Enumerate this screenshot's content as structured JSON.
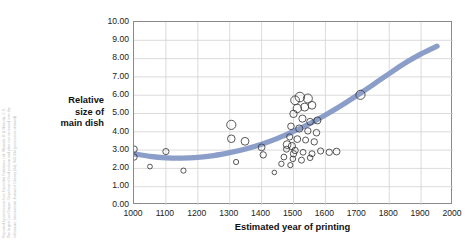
{
  "credit": {
    "lines": [
      "Reprinted by permission from Macmillan Publishers Ltd: Wansink, B. & Wansink, C.S.",
      "The largest Last Supper: Depictions of food portions and plate size increased over the",
      "millennium, International Journal of Obesity (34), 943–944 (permission obtained)"
    ]
  },
  "axes": {
    "y_title": "Relative size of main dish",
    "y_title_lines": [
      "Relative",
      "size of",
      "main dish"
    ],
    "x_title": "Estimated year of printing",
    "y_ticks": [
      "0.00",
      "1.00",
      "2.00",
      "3.00",
      "4.00",
      "5.00",
      "6.00",
      "7.00",
      "8.00",
      "9.00",
      "10.00"
    ],
    "x_ticks": [
      "1000",
      "1100",
      "1200",
      "1300",
      "1400",
      "1500",
      "1600",
      "1700",
      "1800",
      "1900",
      "2000"
    ]
  },
  "colors": {
    "trend_line": "#8b9dc9",
    "marker_stroke": "#3a3a3a",
    "grid": "#d2d2d2",
    "axis": "#8a8a8a",
    "credit_text": "#b9b9b9"
  },
  "chart_data": {
    "type": "scatter",
    "title": "",
    "xlabel": "Estimated year of printing",
    "ylabel": "Relative size of main dish",
    "xlim": [
      1000,
      2000
    ],
    "ylim": [
      0,
      10
    ],
    "xtick_step": 100,
    "ytick_step": 1,
    "grid": true,
    "legend": "none",
    "marker": "open-circle",
    "marker_size_encodes": "bubble-size",
    "points": [
      {
        "x": 1000,
        "y": 3.05,
        "r": 3.3
      },
      {
        "x": 1000,
        "y": 2.62,
        "r": 3.2
      },
      {
        "x": 1050,
        "y": 2.1,
        "r": 2.4
      },
      {
        "x": 1100,
        "y": 2.92,
        "r": 3.1
      },
      {
        "x": 1155,
        "y": 1.88,
        "r": 2.6
      },
      {
        "x": 1305,
        "y": 4.38,
        "r": 4.6
      },
      {
        "x": 1305,
        "y": 3.62,
        "r": 3.8
      },
      {
        "x": 1348,
        "y": 3.48,
        "r": 3.9
      },
      {
        "x": 1320,
        "y": 2.35,
        "r": 2.6
      },
      {
        "x": 1400,
        "y": 3.15,
        "r": 3.4
      },
      {
        "x": 1405,
        "y": 2.74,
        "r": 3.2
      },
      {
        "x": 1440,
        "y": 1.78,
        "r": 2.3
      },
      {
        "x": 1480,
        "y": 3.3,
        "r": 3.9
      },
      {
        "x": 1495,
        "y": 3.22,
        "r": 3.6
      },
      {
        "x": 1500,
        "y": 2.8,
        "r": 3.2
      },
      {
        "x": 1505,
        "y": 5.72,
        "r": 4.4
      },
      {
        "x": 1520,
        "y": 5.9,
        "r": 4.8
      },
      {
        "x": 1545,
        "y": 5.82,
        "r": 4.5
      },
      {
        "x": 1512,
        "y": 5.28,
        "r": 4.2
      },
      {
        "x": 1535,
        "y": 5.35,
        "r": 4.0
      },
      {
        "x": 1558,
        "y": 5.45,
        "r": 3.9
      },
      {
        "x": 1500,
        "y": 4.98,
        "r": 3.7
      },
      {
        "x": 1528,
        "y": 4.72,
        "r": 3.6
      },
      {
        "x": 1552,
        "y": 4.55,
        "r": 3.4
      },
      {
        "x": 1575,
        "y": 4.62,
        "r": 3.5
      },
      {
        "x": 1492,
        "y": 4.3,
        "r": 3.3
      },
      {
        "x": 1518,
        "y": 4.18,
        "r": 3.6
      },
      {
        "x": 1545,
        "y": 4.05,
        "r": 3.2
      },
      {
        "x": 1572,
        "y": 3.95,
        "r": 3.3
      },
      {
        "x": 1488,
        "y": 3.72,
        "r": 3.1
      },
      {
        "x": 1512,
        "y": 3.6,
        "r": 3.4
      },
      {
        "x": 1538,
        "y": 3.55,
        "r": 3.0
      },
      {
        "x": 1565,
        "y": 3.45,
        "r": 3.2
      },
      {
        "x": 1478,
        "y": 3.05,
        "r": 3.0
      },
      {
        "x": 1505,
        "y": 2.98,
        "r": 3.2
      },
      {
        "x": 1530,
        "y": 2.88,
        "r": 2.9
      },
      {
        "x": 1558,
        "y": 2.8,
        "r": 3.0
      },
      {
        "x": 1585,
        "y": 2.95,
        "r": 3.1
      },
      {
        "x": 1470,
        "y": 2.62,
        "r": 2.9
      },
      {
        "x": 1498,
        "y": 2.52,
        "r": 2.8
      },
      {
        "x": 1525,
        "y": 2.45,
        "r": 3.0
      },
      {
        "x": 1552,
        "y": 2.58,
        "r": 2.8
      },
      {
        "x": 1612,
        "y": 2.88,
        "r": 3.2
      },
      {
        "x": 1635,
        "y": 2.92,
        "r": 3.4
      },
      {
        "x": 1462,
        "y": 2.25,
        "r": 2.7
      },
      {
        "x": 1490,
        "y": 2.18,
        "r": 2.6
      },
      {
        "x": 1710,
        "y": 6.02,
        "r": 4.6
      }
    ],
    "trend": {
      "label": "fitted trend",
      "color": "#8b9dc9",
      "width_px": 5.2,
      "points": [
        {
          "x": 1000,
          "y": 2.8
        },
        {
          "x": 1050,
          "y": 2.66
        },
        {
          "x": 1100,
          "y": 2.58
        },
        {
          "x": 1150,
          "y": 2.56
        },
        {
          "x": 1200,
          "y": 2.6
        },
        {
          "x": 1250,
          "y": 2.7
        },
        {
          "x": 1300,
          "y": 2.86
        },
        {
          "x": 1350,
          "y": 3.06
        },
        {
          "x": 1400,
          "y": 3.32
        },
        {
          "x": 1450,
          "y": 3.64
        },
        {
          "x": 1500,
          "y": 4.02
        },
        {
          "x": 1550,
          "y": 4.44
        },
        {
          "x": 1600,
          "y": 4.92
        },
        {
          "x": 1650,
          "y": 5.44
        },
        {
          "x": 1700,
          "y": 6.0
        },
        {
          "x": 1750,
          "y": 6.58
        },
        {
          "x": 1800,
          "y": 7.18
        },
        {
          "x": 1850,
          "y": 7.76
        },
        {
          "x": 1900,
          "y": 8.26
        },
        {
          "x": 1950,
          "y": 8.68
        }
      ]
    }
  }
}
